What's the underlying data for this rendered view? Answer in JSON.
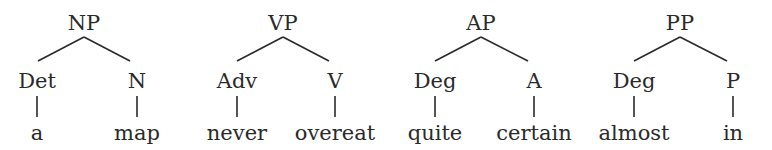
{
  "diagram": {
    "type": "syntax-trees",
    "trees": [
      {
        "root": "NP",
        "children": [
          {
            "category": "Det",
            "word": "a"
          },
          {
            "category": "N",
            "word": "map"
          }
        ]
      },
      {
        "root": "VP",
        "children": [
          {
            "category": "Adv",
            "word": "never"
          },
          {
            "category": "V",
            "word": "overeat"
          }
        ]
      },
      {
        "root": "AP",
        "children": [
          {
            "category": "Deg",
            "word": "quite"
          },
          {
            "category": "A",
            "word": "certain"
          }
        ]
      },
      {
        "root": "PP",
        "children": [
          {
            "category": "Deg",
            "word": "almost"
          },
          {
            "category": "P",
            "word": "in"
          }
        ]
      }
    ]
  }
}
